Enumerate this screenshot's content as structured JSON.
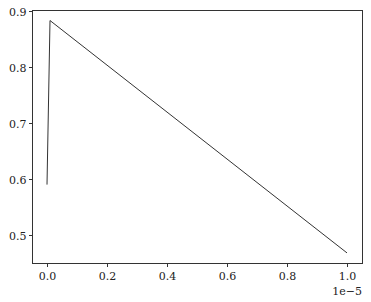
{
  "chart_data": {
    "type": "line",
    "title": "",
    "xlabel": "",
    "ylabel": "",
    "x_offset_label": "1e−5",
    "x": [
      0.0,
      0.01,
      1.0
    ],
    "series": [
      {
        "name": "line",
        "color": "#333333",
        "values": [
          0.59,
          0.883,
          0.468
        ]
      }
    ],
    "xlim": [
      -0.05,
      1.05
    ],
    "ylim": [
      0.445,
      0.902
    ],
    "xticks": [
      0.0,
      0.2,
      0.4,
      0.6,
      0.8,
      1.0
    ],
    "xtick_labels": [
      "0.0",
      "0.2",
      "0.4",
      "0.6",
      "0.8",
      "1.0"
    ],
    "yticks": [
      0.5,
      0.6,
      0.7,
      0.8,
      0.9
    ],
    "ytick_labels": [
      "0.5",
      "0.6",
      "0.7",
      "0.8",
      "0.9"
    ],
    "grid": false,
    "legend": null
  }
}
